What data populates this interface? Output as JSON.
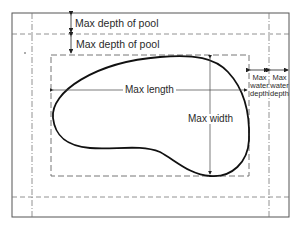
{
  "diagram": {
    "type": "pool-dimension-diagram",
    "labels": {
      "max_depth_pool_upper": "Max depth of pool",
      "max_depth_pool_lower": "Max depth of pool",
      "max_length": "Max length",
      "max_width": "Max width",
      "max_water_depth_left": [
        "Max",
        "water",
        "depth"
      ],
      "max_water_depth_right": [
        "Max",
        "water",
        "depth"
      ]
    },
    "colors": {
      "line": "#222222",
      "frame": "#555555",
      "dashed": "#666666",
      "background": "#ffffff"
    }
  }
}
